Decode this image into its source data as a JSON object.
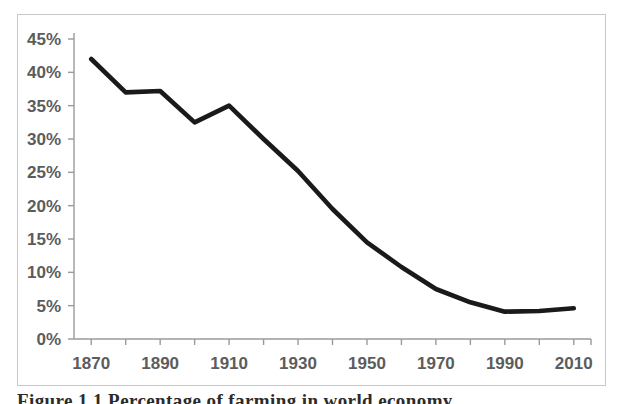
{
  "figure": {
    "caption": "Figure 1.1   Percentage of farming in world economy"
  },
  "chart_data": {
    "type": "line",
    "title": "",
    "xlabel": "",
    "ylabel": "",
    "xlim": [
      1865,
      2015
    ],
    "ylim": [
      0,
      45
    ],
    "grid": false,
    "legend": "none",
    "x_major_ticks": [
      1870,
      1890,
      1910,
      1930,
      1950,
      1970,
      1990,
      2010
    ],
    "x_minor_tick_interval": 10,
    "x_tick_labels": [
      "1870",
      "1890",
      "1910",
      "1930",
      "1950",
      "1970",
      "1990",
      "2010"
    ],
    "y_ticks": [
      0,
      5,
      10,
      15,
      20,
      25,
      30,
      35,
      40,
      45
    ],
    "y_tick_labels": [
      "0%",
      "5%",
      "10%",
      "15%",
      "20%",
      "25%",
      "30%",
      "35%",
      "40%",
      "45%"
    ],
    "series": [
      {
        "name": "Percentage",
        "color": "#1a1a1a",
        "x": [
          1870,
          1880,
          1890,
          1900,
          1910,
          1920,
          1930,
          1940,
          1950,
          1960,
          1970,
          1980,
          1990,
          2000,
          2010
        ],
        "values": [
          42.0,
          37.0,
          37.2,
          32.5,
          35.0,
          30.0,
          25.2,
          19.5,
          14.5,
          10.8,
          7.5,
          5.5,
          4.1,
          4.2,
          4.6
        ]
      }
    ]
  }
}
